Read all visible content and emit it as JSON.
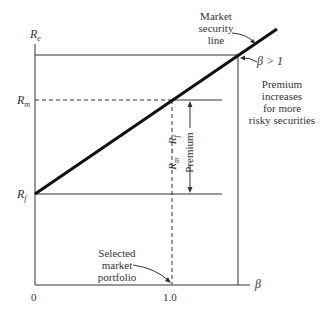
{
  "diagram": {
    "title": "Market security line",
    "axes": {
      "y_label": "R",
      "y_label_sub": "e",
      "x_label": "β",
      "origin_label": "0",
      "x_tick": "1.0"
    },
    "levels": {
      "rm_label": "R",
      "rm_sub": "m",
      "rf_label": "R",
      "rf_sub": "f"
    },
    "annotations": {
      "msl_line1": "Market",
      "msl_line2": "security",
      "msl_line3": "line",
      "beta_gt_one": "β > 1",
      "premium_1": "Premium",
      "premium_2": "increases",
      "premium_3": "for more",
      "premium_4": "risky securities",
      "spread_label": "R",
      "spread_sub1": "m",
      "spread_minus": " − R",
      "spread_sub2": "f",
      "spread_premium": "Premium",
      "selected_1": "Selected",
      "selected_2": "market",
      "selected_3": "portfolio"
    }
  }
}
